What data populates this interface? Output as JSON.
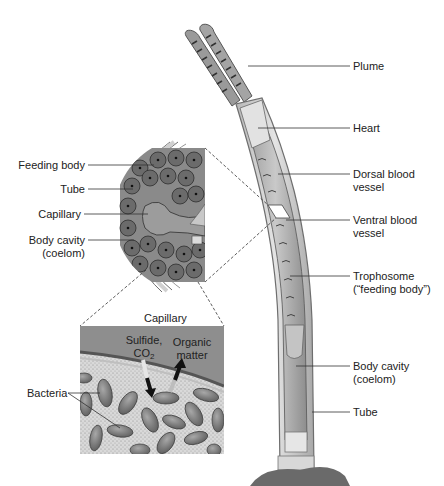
{
  "figure": {
    "colors": {
      "background": "#ffffff",
      "tube": "#d8d8d8",
      "tube_edge": "#7a7a7a",
      "cell_fill": "#6e6e6e",
      "cell_edge": "#3a3a3a",
      "capillary": "#8c8c8c",
      "plume": "#5a5a5a",
      "stipple": "#cfcfcf",
      "bacteria": "#7d7d7d",
      "label_text": "#222222",
      "leader_line": "#333333"
    }
  },
  "worm_labels": [
    {
      "id": "plume",
      "lines": [
        "Plume"
      ]
    },
    {
      "id": "heart",
      "lines": [
        "Heart"
      ]
    },
    {
      "id": "dorsal",
      "lines": [
        "Dorsal blood",
        "vessel"
      ]
    },
    {
      "id": "ventral",
      "lines": [
        "Ventral blood",
        "vessel"
      ]
    },
    {
      "id": "trophosome",
      "lines": [
        "Trophosome",
        "(“feeding body”)"
      ]
    },
    {
      "id": "body_cavity",
      "lines": [
        "Body cavity",
        "(coelom)"
      ]
    },
    {
      "id": "tube",
      "lines": [
        "Tube"
      ]
    }
  ],
  "cross_section_labels": [
    {
      "id": "feeding_body",
      "lines": [
        "Feeding body"
      ]
    },
    {
      "id": "tube",
      "lines": [
        "Tube"
      ]
    },
    {
      "id": "capillary",
      "lines": [
        "Capillary"
      ]
    },
    {
      "id": "body_cavity",
      "lines": [
        "Body cavity",
        "(coelom)"
      ]
    }
  ],
  "inset": {
    "title": "Capillary",
    "sulfide": "Sulfide,",
    "co2_main": "CO",
    "co2_sub": "2",
    "organic_1": "Organic",
    "organic_2": "matter",
    "bacteria": "Bacteria"
  }
}
